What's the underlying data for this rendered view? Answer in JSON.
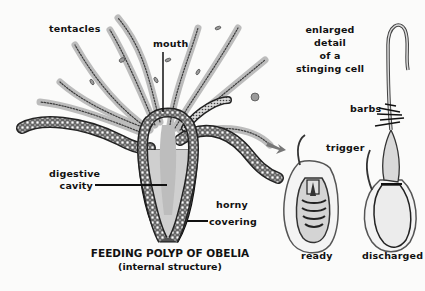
{
  "diagram": {
    "title": "FEEDING POLYP OF OBELIA",
    "subtitle": "(internal structure)",
    "labels": {
      "tentacles": "tentacles",
      "mouth": "mouth",
      "digestive_cavity_line1": "digestive",
      "digestive_cavity_line2": "cavity",
      "horny_covering_line1": "horny",
      "horny_covering_line2": "covering",
      "enlarged_line1": "enlarged",
      "enlarged_line2": "detail",
      "enlarged_line3": "of a",
      "enlarged_line4": "stinging cell",
      "barbs": "barbs",
      "trigger": "trigger",
      "ready": "ready",
      "discharged": "discharged"
    },
    "colors": {
      "ink": "#111111",
      "tissue": "#cfcfcf",
      "arrow": "#777777",
      "background": "#fbfbfa"
    }
  }
}
